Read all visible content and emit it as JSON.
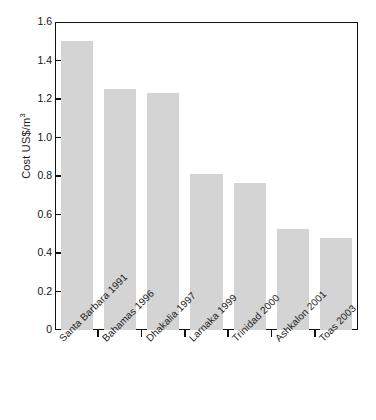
{
  "chart_data": {
    "type": "bar",
    "title": "",
    "subtitle": "",
    "xlabel": "",
    "ylabel": "Cost US$/m",
    "ylabel_superscript": "3",
    "categories": [
      "Santa Barbara 1991",
      "Bahamas 1996",
      "Dhakalia 1997",
      "Larnaka 1999",
      "Trinidad 2000",
      "Ashkalon 2001",
      "Toas 2003"
    ],
    "values": [
      1.5,
      1.25,
      1.23,
      0.81,
      0.765,
      0.525,
      0.48
    ],
    "ylim": [
      0,
      1.6
    ],
    "yticks": [
      0,
      0.2,
      0.4,
      0.6,
      0.8,
      1.0,
      1.2,
      1.4,
      1.6
    ],
    "ytick_labels": [
      "0",
      "0.2",
      "0.4",
      "0.6",
      "0.8",
      "1.0",
      "1.2",
      "1.4",
      "1.6"
    ],
    "grid": false,
    "legend": null,
    "bar_color": "#d4d4d4",
    "axis_color": "#111111"
  }
}
